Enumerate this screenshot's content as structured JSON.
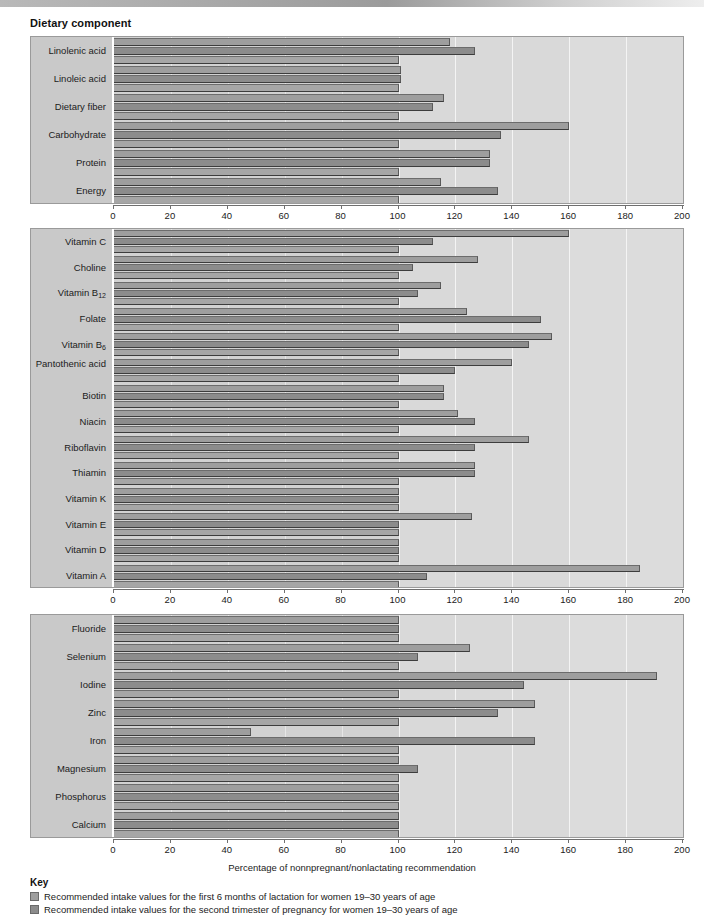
{
  "page_title": "Dietary component",
  "axis_caption": "Percentage of nonnpregnant/nonlactating recommendation",
  "key": {
    "title": "Key",
    "entries": [
      {
        "swatch": "s0",
        "label": "Recommended intake values for the first 6 months of lactation for women 19–30 years of age"
      },
      {
        "swatch": "s1",
        "label": "Recommended intake values for the second trimester of pregnancy for women 19–30 years of age"
      }
    ]
  },
  "chart_data": {
    "type": "bar",
    "orientation": "horizontal",
    "title": "Dietary component",
    "xlabel": "Percentage of nonnpregnant/nonlactating recommendation",
    "ylabel": "Dietary component",
    "xlim": [
      0,
      200
    ],
    "xticks": [
      0,
      20,
      40,
      60,
      80,
      100,
      120,
      140,
      160,
      180,
      200
    ],
    "grid": true,
    "reference_line": 100,
    "series": [
      {
        "name": "Recommended intake values for the first 6 months of lactation for women 19–30 years of age",
        "color": "#9e9e9e"
      },
      {
        "name": "Recommended intake values for the second trimester of pregnancy for women 19–30 years of age",
        "color": "#8c8c8c"
      },
      {
        "name": "Nonpregnant/nonlactating baseline",
        "color": "#a6a6a6"
      }
    ],
    "panels": [
      {
        "id": "macronutrients",
        "categories": [
          "Linolenic acid",
          "Linoleic acid",
          "Dietary fiber",
          "Carbohydrate",
          "Protein",
          "Energy"
        ],
        "lactation": [
          118,
          101,
          116,
          160,
          132,
          115
        ],
        "pregnancy": [
          127,
          101,
          112,
          136,
          132,
          135
        ],
        "baseline": [
          100,
          100,
          100,
          100,
          100,
          100
        ]
      },
      {
        "id": "vitamins",
        "categories": [
          "Vitamin C",
          "Choline",
          "Vitamin B12",
          "Folate",
          "Vitamin B6",
          "Pantothenic acid",
          "Biotin",
          "Niacin",
          "Riboflavin",
          "Thiamin",
          "Vitamin K",
          "Vitamin E",
          "Vitamin D",
          "Vitamin A"
        ],
        "lactation": [
          160,
          128,
          115,
          124,
          154,
          140,
          116,
          121,
          146,
          127,
          100,
          126,
          100,
          185
        ],
        "pregnancy": [
          112,
          105,
          107,
          150,
          146,
          120,
          116,
          127,
          127,
          127,
          100,
          100,
          100,
          110
        ],
        "baseline": [
          100,
          100,
          100,
          100,
          100,
          100,
          100,
          100,
          100,
          100,
          100,
          100,
          100,
          100
        ]
      },
      {
        "id": "minerals",
        "categories": [
          "Fluoride",
          "Selenium",
          "Iodine",
          "Zinc",
          "Iron",
          "Magnesium",
          "Phosphorus",
          "Calcium"
        ],
        "lactation": [
          100,
          125,
          191,
          148,
          48,
          100,
          100,
          100
        ],
        "pregnancy": [
          100,
          107,
          144,
          135,
          148,
          107,
          100,
          100
        ],
        "baseline": [
          100,
          100,
          100,
          100,
          100,
          100,
          100,
          100
        ]
      }
    ]
  },
  "panel_labels": {
    "p0": [
      "Linolenic acid",
      "Linoleic acid",
      "Dietary fiber",
      "Carbohydrate",
      "Protein",
      "Energy"
    ],
    "p1": [
      "Vitamin C",
      "Choline",
      "Vitamin B",
      "Folate",
      "Vitamin B",
      "Pantothenic acid",
      "Biotin",
      "Niacin",
      "Riboflavin",
      "Thiamin",
      "Vitamin K",
      "Vitamin E",
      "Vitamin D",
      "Vitamin A"
    ],
    "p2": [
      "Fluoride",
      "Selenium",
      "Iodine",
      "Zinc",
      "Iron",
      "Magnesium",
      "Phosphorus",
      "Calcium"
    ],
    "sub_b12": "12",
    "sub_b6": "6"
  }
}
